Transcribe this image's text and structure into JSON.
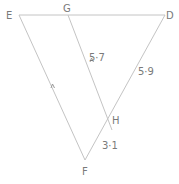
{
  "diagram": {
    "vertices": {
      "E": "E",
      "G": "G",
      "D": "D",
      "H": "H",
      "F": "F"
    },
    "lengths": {
      "GH": "5·7",
      "DH": "5·9",
      "HF": "3·1"
    },
    "colors": {
      "line": "#c4c4c4",
      "text": "#7a7a7a"
    }
  }
}
